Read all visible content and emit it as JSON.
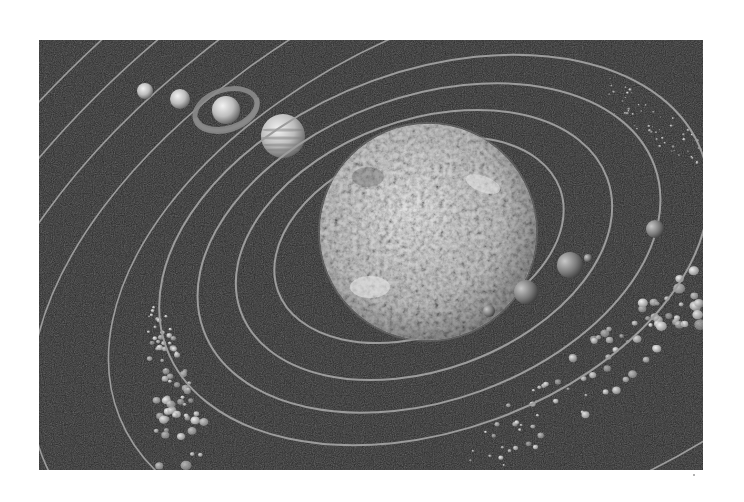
{
  "image": {
    "caption": "Solar system illustration (grayscale): Sun with inner planets, outer planets, and asteroid belts",
    "background": "#ffffff",
    "frame": {
      "x": 39,
      "y": 40,
      "width": 664,
      "height": 430,
      "fill": "#262626"
    },
    "colors": {
      "space": "#262626",
      "orbit": "#9c9c9c",
      "sun_base": "#a8a8a8",
      "sun_highlight": "#e8e8e8",
      "planet_light": "#e6e6e6",
      "planet_dark": "#6e6e6e",
      "asteroid": "#d2d2d2"
    }
  },
  "sun": {
    "cx": 389,
    "cy": 192,
    "r": 108
  },
  "inner_orbits": [
    {
      "name": "orbit-mercury",
      "cx": 380,
      "cy": 200,
      "rx": 150,
      "ry": 95,
      "rot": -20
    },
    {
      "name": "orbit-venus",
      "cx": 385,
      "cy": 205,
      "rx": 195,
      "ry": 125,
      "rot": -20
    },
    {
      "name": "orbit-earth",
      "cx": 390,
      "cy": 208,
      "rx": 240,
      "ry": 152,
      "rot": -20
    },
    {
      "name": "orbit-mars",
      "cx": 395,
      "cy": 210,
      "rx": 285,
      "ry": 180,
      "rot": -20
    }
  ],
  "outer_orbits": [
    {
      "name": "orbit-jupiter",
      "cx": 470,
      "cy": 220,
      "rx": 420,
      "ry": 250,
      "rot": -22
    },
    {
      "name": "orbit-saturn",
      "cx": 500,
      "cy": 205,
      "rx": 540,
      "ry": 300,
      "rot": -24
    },
    {
      "name": "orbit-uranus",
      "cx": 520,
      "cy": 200,
      "rx": 640,
      "ry": 350,
      "rot": -26
    },
    {
      "name": "orbit-neptune",
      "cx": 540,
      "cy": 195,
      "rx": 740,
      "ry": 400,
      "rot": -28
    },
    {
      "name": "orbit-pluto",
      "cx": 560,
      "cy": 190,
      "rx": 850,
      "ry": 450,
      "rot": -30
    }
  ],
  "planets": [
    {
      "name": "mercury",
      "cx": 450,
      "cy": 271,
      "r": 6
    },
    {
      "name": "venus",
      "cx": 487,
      "cy": 252,
      "r": 12
    },
    {
      "name": "earth",
      "cx": 531,
      "cy": 225,
      "r": 13
    },
    {
      "name": "moon",
      "cx": 549,
      "cy": 218,
      "r": 4
    },
    {
      "name": "mars",
      "cx": 616,
      "cy": 189,
      "r": 9
    },
    {
      "name": "jupiter",
      "cx": 244,
      "cy": 96,
      "r": 22
    },
    {
      "name": "saturn",
      "cx": 187,
      "cy": 70,
      "r": 14,
      "ring_rx": 32,
      "ring_ry": 20
    },
    {
      "name": "uranus",
      "cx": 141,
      "cy": 59,
      "r": 10
    },
    {
      "name": "neptune",
      "cx": 106,
      "cy": 51,
      "r": 8
    }
  ],
  "asteroid_belts": [
    {
      "name": "belt-lower-left",
      "x0": 95,
      "y0": 260,
      "x1": 200,
      "y1": 430,
      "count": 70
    },
    {
      "name": "belt-lower-right",
      "x0": 430,
      "y0": 250,
      "x1": 664,
      "y1": 430,
      "count": 90
    },
    {
      "name": "belt-upper-right",
      "x0": 570,
      "y0": 55,
      "x1": 664,
      "y1": 130,
      "count": 55
    }
  ]
}
